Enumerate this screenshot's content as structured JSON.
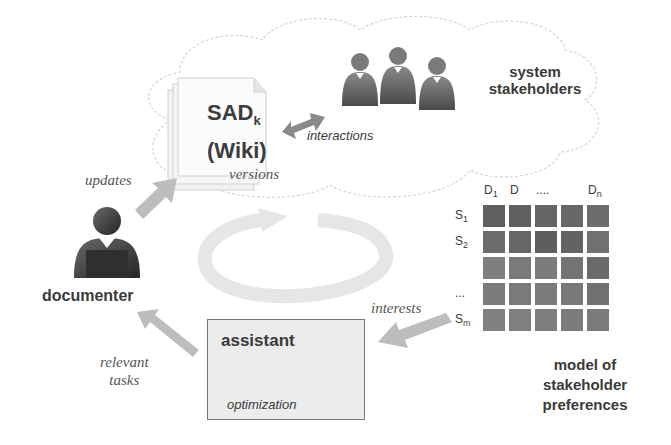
{
  "diagram": {
    "cloud": {
      "document": {
        "title_main": "SAD",
        "title_sub": "k",
        "title_line2": "(Wiki)",
        "versions_label": "versions"
      },
      "interactions_label": "interactions",
      "stakeholders_label_line1": "system",
      "stakeholders_label_line2": "stakeholders"
    },
    "documenter": {
      "label": "documenter",
      "updates_label": "updates",
      "relevant_tasks_line1": "relevant",
      "relevant_tasks_line2": "tasks"
    },
    "assistant": {
      "title": "assistant",
      "caption": "optimization"
    },
    "matrix": {
      "interests_label": "interests",
      "col_headers": [
        "D1",
        "D",
        "....",
        "",
        "Dn"
      ],
      "col_header_parts": [
        {
          "main": "D",
          "sub": "1"
        },
        {
          "main": "D",
          "sub": ""
        },
        {
          "main": "....",
          "sub": ""
        },
        {
          "main": "",
          "sub": ""
        },
        {
          "main": "D",
          "sub": "n"
        }
      ],
      "row_headers": [
        {
          "main": "S",
          "sub": "1"
        },
        {
          "main": "S",
          "sub": "2"
        },
        {
          "main": "",
          "sub": ""
        },
        {
          "main": "...",
          "sub": ""
        },
        {
          "main": "S",
          "sub": "m"
        }
      ],
      "cell_colors": [
        [
          "#5f5f5f",
          "#606060",
          "#656565",
          "#676767",
          "#6d6d6d"
        ],
        [
          "#6c6c6c",
          "#666666",
          "#5e5e5e",
          "#636363",
          "#707070"
        ],
        [
          "#7e7e7e",
          "#7a7a7a",
          "#7c7c7c",
          "#747474",
          "#6a6a6a"
        ],
        [
          "#7c7c7c",
          "#7a7a7a",
          "#7b7b7b",
          "#787878",
          "#707070"
        ],
        [
          "#808080",
          "#7f7f7f",
          "#7e7e7e",
          "#7c7c7c",
          "#7a7a7a"
        ]
      ],
      "caption_line1": "model of",
      "caption_line2": "stakeholder preferences"
    }
  }
}
